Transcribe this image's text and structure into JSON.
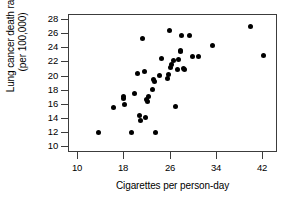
{
  "chart_data": {
    "type": "scatter",
    "title": "",
    "xlabel": "Cigarettes per person-day",
    "ylabel_line1": "Lung cancer death rate",
    "ylabel_line2": "(per 100,000)",
    "xlim": [
      8.5,
      44.5
    ],
    "ylim": [
      9.2,
      28.7
    ],
    "xticks": [
      10,
      18,
      26,
      34,
      42
    ],
    "yticks": [
      10,
      12,
      14,
      16,
      18,
      20,
      22,
      24,
      26,
      28
    ],
    "grid": false,
    "legend": null,
    "marker": "filled-circle",
    "marker_color": "#000000",
    "points": [
      {
        "x": 13.8,
        "y": 11.9
      },
      {
        "x": 16.3,
        "y": 15.5
      },
      {
        "x": 18.0,
        "y": 17.1
      },
      {
        "x": 18.0,
        "y": 16.8
      },
      {
        "x": 18.2,
        "y": 15.9
      },
      {
        "x": 19.4,
        "y": 12.0
      },
      {
        "x": 20.0,
        "y": 17.4
      },
      {
        "x": 20.5,
        "y": 20.3
      },
      {
        "x": 20.8,
        "y": 14.3
      },
      {
        "x": 21.0,
        "y": 13.7
      },
      {
        "x": 21.4,
        "y": 25.3
      },
      {
        "x": 21.6,
        "y": 20.6
      },
      {
        "x": 21.8,
        "y": 14.1
      },
      {
        "x": 22.1,
        "y": 16.6
      },
      {
        "x": 22.2,
        "y": 16.3
      },
      {
        "x": 22.4,
        "y": 17.0
      },
      {
        "x": 23.0,
        "y": 18.1
      },
      {
        "x": 23.2,
        "y": 19.4
      },
      {
        "x": 23.4,
        "y": 19.2
      },
      {
        "x": 23.5,
        "y": 12.0
      },
      {
        "x": 24.2,
        "y": 20.0
      },
      {
        "x": 24.6,
        "y": 22.4
      },
      {
        "x": 25.6,
        "y": 19.6
      },
      {
        "x": 25.8,
        "y": 20.1
      },
      {
        "x": 26.0,
        "y": 26.3
      },
      {
        "x": 26.1,
        "y": 21.1
      },
      {
        "x": 26.4,
        "y": 21.5
      },
      {
        "x": 26.6,
        "y": 22.1
      },
      {
        "x": 27.0,
        "y": 15.7
      },
      {
        "x": 27.3,
        "y": 20.9
      },
      {
        "x": 27.6,
        "y": 22.3
      },
      {
        "x": 27.8,
        "y": 23.4
      },
      {
        "x": 27.9,
        "y": 23.6
      },
      {
        "x": 28.0,
        "y": 25.7
      },
      {
        "x": 28.4,
        "y": 21.0
      },
      {
        "x": 28.6,
        "y": 20.9
      },
      {
        "x": 29.5,
        "y": 25.6
      },
      {
        "x": 30.0,
        "y": 22.7
      },
      {
        "x": 31.0,
        "y": 22.7
      },
      {
        "x": 33.4,
        "y": 24.3
      },
      {
        "x": 40.0,
        "y": 26.9
      },
      {
        "x": 42.2,
        "y": 22.8
      }
    ]
  }
}
